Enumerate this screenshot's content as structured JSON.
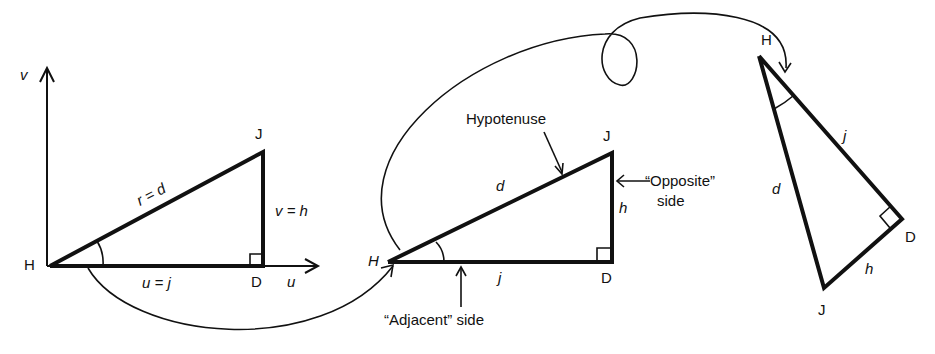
{
  "figure": {
    "colors": {
      "ink": "#111111",
      "background": "#ffffff"
    }
  },
  "left_diagram": {
    "axis_v_label": "v",
    "axis_u_label": "u",
    "vertex_H": "H",
    "vertex_J": "J",
    "vertex_D": "D",
    "hypotenuse_label": "r = d",
    "vertical_side_label": "v = h",
    "horizontal_side_label": "u = j"
  },
  "middle_diagram": {
    "vertex_H": "H",
    "vertex_J": "J",
    "vertex_D": "D",
    "hypotenuse_side_label": "d",
    "opposite_side_label": "h",
    "adjacent_side_label": "j",
    "callout_hypotenuse": "Hypotenuse",
    "callout_opposite_line1": "“Opposite”",
    "callout_opposite_line2": "side",
    "callout_adjacent": "“Adjacent” side"
  },
  "right_diagram": {
    "vertex_H": "H",
    "vertex_J": "J",
    "vertex_D": "D",
    "hypotenuse_side_label": "d",
    "adjacent_side_label": "j",
    "opposite_side_label": "h"
  },
  "arrows": [
    {
      "from": "left_diagram",
      "to": "middle_diagram",
      "path": "curved under"
    },
    {
      "from": "middle_diagram",
      "to": "right_diagram",
      "path": "looping over"
    }
  ]
}
